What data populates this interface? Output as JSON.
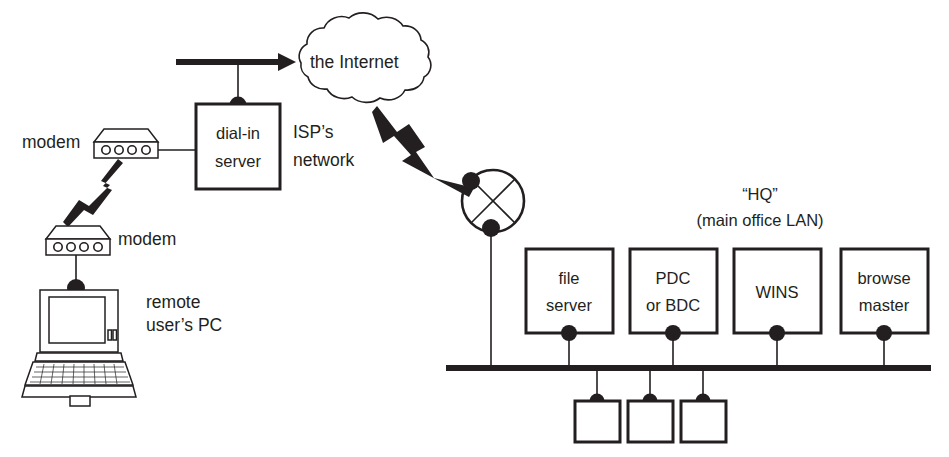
{
  "diagram": {
    "colors": {
      "ink": "#231f20",
      "background": "#ffffff"
    },
    "labels": {
      "internet": "the Internet",
      "isp_network_line1": "ISP’s",
      "isp_network_line2": "network",
      "dial_in_server_line1": "dial-in",
      "dial_in_server_line2": "server",
      "modem_top": "modem",
      "modem_bottom": "modem",
      "remote_pc_line1": "remote",
      "remote_pc_line2": "user’s PC",
      "hq_line1": "“HQ”",
      "hq_line2": "(main office LAN)"
    },
    "servers": [
      {
        "name": "file-server",
        "line1": "file",
        "line2": "server"
      },
      {
        "name": "pdc-or-bdc",
        "line1": "PDC",
        "line2": "or BDC"
      },
      {
        "name": "wins-server",
        "line1": "WINS",
        "line2": ""
      },
      {
        "name": "browse-master",
        "line1": "browse",
        "line2": "master"
      }
    ],
    "workstations": [
      {
        "name": "workstation-1",
        "label": ""
      },
      {
        "name": "workstation-2",
        "label": ""
      },
      {
        "name": "workstation-3",
        "label": ""
      }
    ],
    "nodes": {
      "cloud": "the Internet",
      "router": "router",
      "bus": "ethernet-bus"
    },
    "caption": ""
  }
}
